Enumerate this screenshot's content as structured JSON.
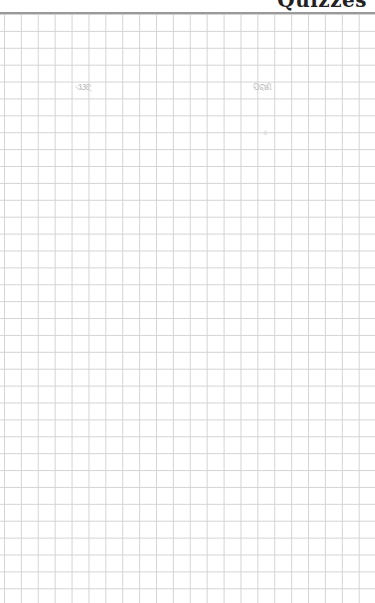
{
  "page": {
    "header_text": "Quizzes",
    "scribbles": [
      {
        "text": "ଏଓବ୍‌"
      },
      {
        "text": "ପରାଣ"
      },
      {
        "text": "ଃ"
      }
    ]
  },
  "colors": {
    "rule": "#9a9a9a",
    "grid": "#d4d4d4",
    "background": "#ffffff"
  }
}
